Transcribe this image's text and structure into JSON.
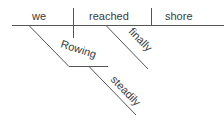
{
  "diagram": {
    "type": "sentence-diagram",
    "colors": {
      "line": "#555555",
      "text": "#3a3a3a",
      "background": "#ffffff"
    },
    "baseline": {
      "subject": "we",
      "verb": "reached",
      "object": "shore"
    },
    "modifiers": {
      "participle": "Rowing",
      "participle_adverb": "steadily",
      "verb_adverb": "finally"
    }
  }
}
